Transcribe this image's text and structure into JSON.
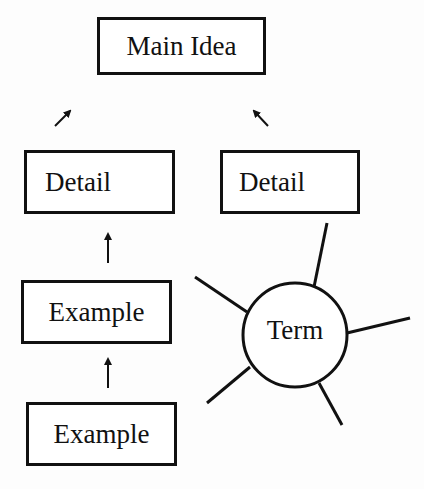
{
  "diagram": {
    "main_idea": {
      "label": "Main Idea"
    },
    "details": [
      {
        "label": "Detail"
      },
      {
        "label": "Detail"
      }
    ],
    "examples": [
      {
        "label": "Example"
      },
      {
        "label": "Example"
      }
    ],
    "term": {
      "label": "Term",
      "spoke_count": 5
    },
    "colors": {
      "stroke": "#111111",
      "background": "#ffffff"
    },
    "connectors": [
      {
        "from": "detail-left",
        "to": "main-idea",
        "type": "arrow-ne"
      },
      {
        "from": "detail-right",
        "to": "main-idea",
        "type": "arrow-nw"
      },
      {
        "from": "example-1",
        "to": "detail-left",
        "type": "arrow-up"
      },
      {
        "from": "example-2",
        "to": "example-1",
        "type": "arrow-up"
      }
    ]
  }
}
